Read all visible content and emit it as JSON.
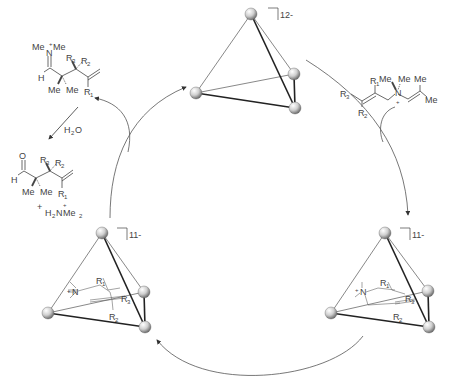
{
  "diagram": {
    "type": "catalytic-cycle",
    "host_empty": {
      "charge": "12-"
    },
    "host_substrate_complex": {
      "charge": "11-"
    },
    "host_product_complex": {
      "charge": "11-"
    },
    "substrate": {
      "groups": [
        "R3",
        "R1",
        "R2",
        "Me",
        "Me",
        "Me",
        "Me"
      ],
      "labels": {
        "r1": "R",
        "r1_sub": "1",
        "r2": "R",
        "r2_sub": "2",
        "r3": "R",
        "r3_sub": "3",
        "me": "Me",
        "n": "N",
        "plus": "+"
      }
    },
    "iminium_product": {
      "labels": {
        "me": "Me",
        "n": "N",
        "plus": "+",
        "h": "H",
        "r1": "R",
        "r1_sub": "1",
        "r2": "R",
        "r2_sub": "2",
        "r3": "R",
        "r3_sub": "3"
      }
    },
    "hydrolysis": {
      "reagent": "H",
      "reagent_sub": "2",
      "reagent_tail": "O"
    },
    "aldehyde_product": {
      "labels": {
        "o": "O",
        "h": "H",
        "me": "Me",
        "r1": "R",
        "r1_sub": "1",
        "r2": "R",
        "r2_sub": "2",
        "r3": "R",
        "r3_sub": "3"
      }
    },
    "byproduct": {
      "plus_sign": "+",
      "text_h": "H",
      "text_h_sub": "2",
      "text_n": "N",
      "text_me": "Me",
      "text_me_sub": "2",
      "charge": "+"
    },
    "colors": {
      "line": "#333333",
      "arrow": "#555555",
      "sphere_light": "#f4f4f4",
      "sphere_dark": "#7a7a7a"
    }
  }
}
